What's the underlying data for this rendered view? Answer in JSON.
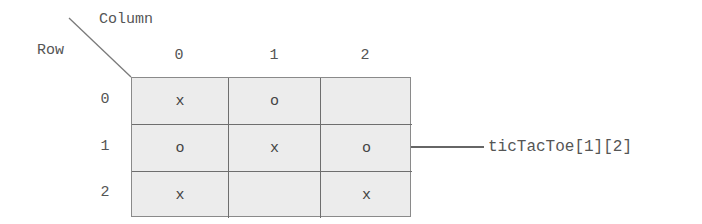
{
  "diagram": {
    "column_axis_label": "Column",
    "row_axis_label": "Row",
    "column_headers": [
      "0",
      "1",
      "2"
    ],
    "row_headers": [
      "0",
      "1",
      "2"
    ],
    "cells": [
      [
        "x",
        "o",
        ""
      ],
      [
        "o",
        "x",
        "o"
      ],
      [
        "x",
        "",
        "x"
      ]
    ],
    "pointer": {
      "label": "ticTacToe[1][2]",
      "target_row": 1,
      "target_col": 2
    },
    "colors": {
      "cell_fill": "#ececec",
      "grid_line": "#6e6e6e",
      "text": "#555555",
      "arrow": "#666666"
    }
  }
}
